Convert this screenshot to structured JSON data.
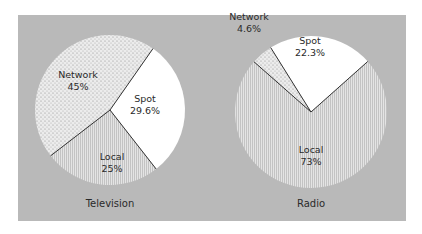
{
  "chart_data": [
    {
      "type": "pie",
      "title": "Television",
      "slices": [
        {
          "label": "Network",
          "value": 45,
          "value_label": "45%",
          "pattern": "stipple"
        },
        {
          "label": "Spot",
          "value": 29.6,
          "value_label": "29.6%",
          "pattern": "white"
        },
        {
          "label": "Local",
          "value": 25,
          "value_label": "25%",
          "pattern": "vertical-lines"
        }
      ]
    },
    {
      "type": "pie",
      "title": "Radio",
      "slices": [
        {
          "label": "Network",
          "value": 4.6,
          "value_label": "4.6%",
          "pattern": "stipple"
        },
        {
          "label": "Spot",
          "value": 22.3,
          "value_label": "22.3%",
          "pattern": "white"
        },
        {
          "label": "Local",
          "value": 73,
          "value_label": "73%",
          "pattern": "vertical-lines"
        }
      ]
    }
  ],
  "colors": {
    "panel": "#b9b9b9",
    "slice_white": "#ffffff",
    "stipple_bg": "#e8e8e8",
    "lines_bg": "#d9d9d9",
    "edge": "#333333"
  }
}
